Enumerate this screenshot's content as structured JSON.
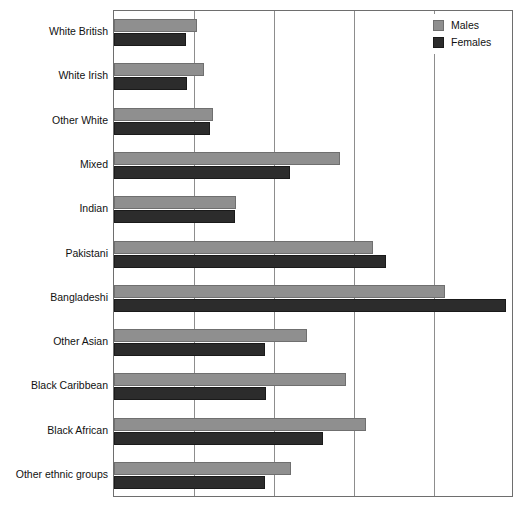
{
  "chart_data": {
    "type": "bar",
    "orientation": "horizontal",
    "title": "",
    "xlabel": "",
    "ylabel": "",
    "xlim": [
      0,
      5
    ],
    "gridlines_x": [
      1,
      2,
      3,
      4
    ],
    "grid": true,
    "tick_labels_x": [],
    "legend_position": "top-right",
    "categories": [
      "White British",
      "White Irish",
      "Other White",
      "Mixed",
      "Indian",
      "Pakistani",
      "Bangladeshi",
      "Other Asian",
      "Black Caribbean",
      "Black African",
      "Other ethnic groups"
    ],
    "series": [
      {
        "name": "Males",
        "color": "#8f8f8f",
        "values": [
          1.04,
          1.13,
          1.24,
          2.83,
          1.53,
          3.24,
          4.14,
          2.41,
          2.9,
          3.15,
          2.21
        ]
      },
      {
        "name": "Females",
        "color": "#2c2c2c",
        "values": [
          0.9,
          0.91,
          1.2,
          2.2,
          1.51,
          3.4,
          4.9,
          1.89,
          1.9,
          2.61,
          1.89
        ]
      }
    ]
  },
  "legend": {
    "items": [
      {
        "label": "Males",
        "swatch": "males-swatch"
      },
      {
        "label": "Females",
        "swatch": "females-swatch"
      }
    ]
  }
}
